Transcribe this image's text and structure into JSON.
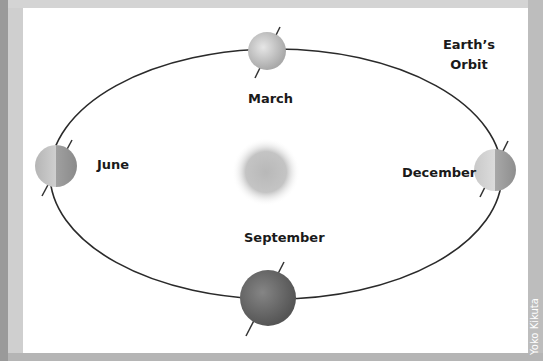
{
  "title": {
    "line1": "Earth’s",
    "line2": "Orbit"
  },
  "months": {
    "march": "March",
    "june": "June",
    "september": "September",
    "december": "December"
  },
  "credit": "Yoko Kikuta",
  "colors": {
    "orbit": "#2a2a2a",
    "sun": "#bdbdbd",
    "earth_light": "#d8d8d8",
    "earth_dark": "#6e6e6e",
    "panel": "#ffffff",
    "frame": "#c9c9c9"
  }
}
